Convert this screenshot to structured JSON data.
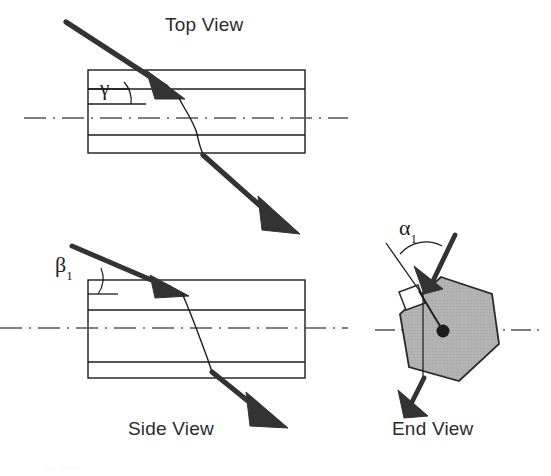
{
  "figure": {
    "background_color": "#ffffff",
    "line_color": "#1c1c1c",
    "hexagon_fill_color": "#b3b3b3",
    "arrow_color": "#333333",
    "centerline_color": "#555555"
  },
  "views": {
    "top": {
      "label": "Top View",
      "angle": {
        "symbol": "γ",
        "subscript": "",
        "name": "gamma"
      }
    },
    "side": {
      "label": "Side View",
      "angle": {
        "symbol": "β",
        "subscript": "1",
        "name": "beta-one"
      }
    },
    "end": {
      "label": "End View",
      "angle": {
        "symbol": "α",
        "subscript": "1",
        "name": "alpha-one"
      }
    }
  },
  "artifact": {
    "faint_text": "··· ····"
  }
}
